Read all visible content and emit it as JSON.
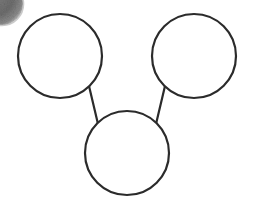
{
  "canvas": {
    "width": 253,
    "height": 204,
    "background_color": "#ffffff"
  },
  "diagram": {
    "type": "node-link-diagram",
    "stroke_color": "#2b2b2b",
    "stroke_width": 2.2,
    "node_fill_color": "#ffffff",
    "nodes": [
      {
        "id": "node-top-left",
        "label": "",
        "cx": 60,
        "cy": 56,
        "r": 42
      },
      {
        "id": "node-top-right",
        "label": "",
        "cx": 194,
        "cy": 56,
        "r": 42
      },
      {
        "id": "node-bottom-center",
        "label": "",
        "cx": 127,
        "cy": 153,
        "r": 42
      }
    ],
    "edges": [
      {
        "id": "edge-top-left-to-bottom",
        "from": "node-top-left",
        "to": "node-bottom-center",
        "x1": 89,
        "y1": 86,
        "x2": 98,
        "y2": 124
      },
      {
        "id": "edge-top-right-to-bottom",
        "from": "node-top-right",
        "to": "node-bottom-center",
        "x1": 165,
        "y1": 86,
        "x2": 156,
        "y2": 124
      }
    ]
  },
  "artifacts": {
    "corner_smudge": {
      "name": "dark-smudge-blob",
      "cx": 2,
      "cy": 4,
      "r": 21,
      "color": "#6e6e6e",
      "edge_color": "#8f8f8f",
      "description": "grainy dark-gray blob clipped by the top-left image corner"
    }
  }
}
